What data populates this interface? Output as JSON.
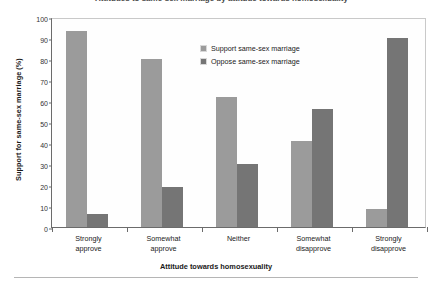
{
  "figure": {
    "clipped_title": "Attitudes to same-sex marriage by attitude towards homosexuality"
  },
  "chart_data": {
    "type": "bar",
    "title": "",
    "xlabel": "Attitude towards homosexuality",
    "ylabel": "Support for same-sex marriage (%)",
    "categories": [
      "Strongly approve",
      "Somewhat approve",
      "Neither",
      "Somewhat disapprove",
      "Strongly disapprove"
    ],
    "category_lines": [
      [
        "Strongly",
        "approve"
      ],
      [
        "Somewhat",
        "approve"
      ],
      [
        "Neither",
        ""
      ],
      [
        "Somewhat",
        "disapprove"
      ],
      [
        "Strongly",
        "disapprove"
      ]
    ],
    "series": [
      {
        "name": "Support same-sex marriage",
        "color": "#9b9b9b",
        "values": [
          93.5,
          80,
          62,
          41,
          8.5
        ]
      },
      {
        "name": "Oppose same-sex marriage",
        "color": "#757575",
        "values": [
          6,
          19,
          30,
          56,
          90
        ]
      }
    ],
    "ylim": [
      0,
      100
    ],
    "yticks": [
      0,
      10,
      20,
      30,
      40,
      50,
      60,
      70,
      80,
      90,
      100
    ],
    "ytick_labels": [
      "0",
      "10",
      "20",
      "30",
      "40",
      "50",
      "60",
      "70",
      "80",
      "90",
      "100"
    ],
    "grid": false,
    "legend_position": "upper center"
  }
}
